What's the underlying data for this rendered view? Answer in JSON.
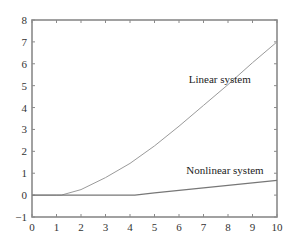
{
  "chart_data": {
    "type": "line",
    "title": "",
    "xlabel": "",
    "ylabel": "",
    "xlim": [
      0,
      10
    ],
    "ylim": [
      -1,
      8
    ],
    "grid": false,
    "x_ticks": [
      "0",
      "1",
      "2",
      "3",
      "4",
      "5",
      "6",
      "7",
      "8",
      "9",
      "10"
    ],
    "y_ticks": [
      "-1",
      "0",
      "1",
      "2",
      "3",
      "4",
      "5",
      "6",
      "7",
      "8"
    ],
    "series": [
      {
        "name": "Linear system",
        "x": [
          0,
          1,
          1.2,
          2,
          3,
          4,
          5,
          6,
          7,
          8,
          9,
          10
        ],
        "values": [
          0,
          0,
          0,
          0.25,
          0.8,
          1.45,
          2.25,
          3.15,
          4.1,
          5.05,
          6.05,
          7.0
        ]
      },
      {
        "name": "Nonlinear system",
        "x": [
          0,
          1,
          2,
          3,
          4,
          4.2,
          5,
          6,
          7,
          8,
          9,
          10
        ],
        "values": [
          0,
          0,
          0,
          0,
          0,
          0,
          0.1,
          0.22,
          0.33,
          0.45,
          0.56,
          0.67
        ]
      }
    ],
    "annotations": [
      {
        "text": "Linear system",
        "x": 6.4,
        "y": 5.1
      },
      {
        "text": "Nonlinear system",
        "x": 6.3,
        "y": 0.95
      }
    ]
  }
}
